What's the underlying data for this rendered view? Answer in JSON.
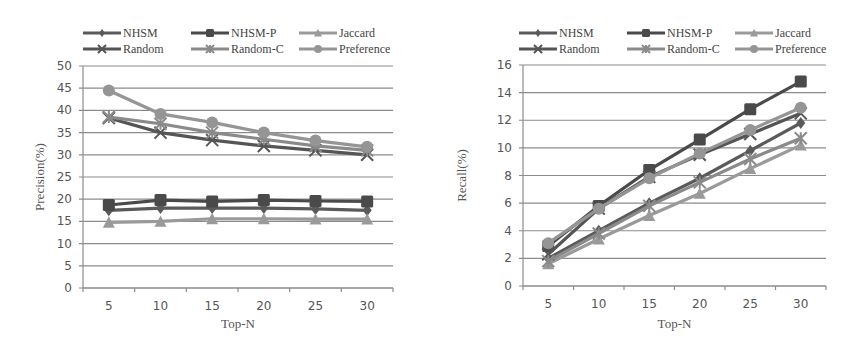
{
  "chart_data": [
    {
      "type": "line",
      "title": "",
      "xlabel": "Top-N",
      "ylabel": "Precision(%)",
      "categories": [
        "5",
        "10",
        "15",
        "20",
        "25",
        "30"
      ],
      "ylim": [
        0,
        50
      ],
      "yticks": [
        0,
        5,
        10,
        15,
        20,
        25,
        30,
        35,
        40,
        45,
        50
      ],
      "grid": true,
      "legend_position": "top",
      "series": [
        {
          "name": "NHSM",
          "color": "#5a5a5a",
          "marker": "diamond",
          "values": [
            17.5,
            18.0,
            18.0,
            18.0,
            17.8,
            17.5
          ]
        },
        {
          "name": "NHSM-P",
          "color": "#4a4a4a",
          "marker": "square",
          "values": [
            18.7,
            19.8,
            19.5,
            19.8,
            19.6,
            19.5
          ]
        },
        {
          "name": "Jaccard",
          "color": "#9a9a9a",
          "marker": "triangle",
          "values": [
            14.8,
            15.0,
            15.6,
            15.6,
            15.5,
            15.5
          ]
        },
        {
          "name": "Random",
          "color": "#555555",
          "marker": "x",
          "values": [
            38.3,
            35.0,
            33.3,
            32.0,
            31.0,
            30.0
          ]
        },
        {
          "name": "Random-C",
          "color": "#8a8a8a",
          "marker": "star",
          "values": [
            38.5,
            37.0,
            35.0,
            33.5,
            32.0,
            31.0
          ]
        },
        {
          "name": "Preference",
          "color": "#959595",
          "marker": "circle",
          "values": [
            44.5,
            39.2,
            37.3,
            35.0,
            33.2,
            31.8
          ]
        }
      ]
    },
    {
      "type": "line",
      "title": "",
      "xlabel": "Top-N",
      "ylabel": "Recall(%)",
      "categories": [
        "5",
        "10",
        "15",
        "20",
        "25",
        "30"
      ],
      "ylim": [
        0,
        16
      ],
      "yticks": [
        0,
        2,
        4,
        6,
        8,
        10,
        12,
        14,
        16
      ],
      "grid": true,
      "legend_position": "top",
      "series": [
        {
          "name": "NHSM",
          "color": "#5a5a5a",
          "marker": "diamond",
          "values": [
            2.0,
            4.0,
            6.0,
            7.8,
            9.8,
            11.8
          ]
        },
        {
          "name": "NHSM-P",
          "color": "#4a4a4a",
          "marker": "square",
          "values": [
            2.9,
            5.8,
            8.4,
            10.6,
            12.8,
            14.8
          ]
        },
        {
          "name": "Jaccard",
          "color": "#9a9a9a",
          "marker": "triangle",
          "values": [
            1.6,
            3.4,
            5.1,
            6.7,
            8.5,
            10.2
          ]
        },
        {
          "name": "Random",
          "color": "#555555",
          "marker": "x",
          "values": [
            2.3,
            5.6,
            7.9,
            9.5,
            11.0,
            12.5
          ]
        },
        {
          "name": "Random-C",
          "color": "#8a8a8a",
          "marker": "star",
          "values": [
            1.8,
            3.8,
            5.8,
            7.5,
            9.2,
            10.7
          ]
        },
        {
          "name": "Preference",
          "color": "#959595",
          "marker": "circle",
          "values": [
            3.1,
            5.6,
            7.8,
            9.6,
            11.3,
            12.9
          ]
        }
      ]
    }
  ],
  "charts": [
    {
      "ylabel": "Precision(%)",
      "xlabel": "Top-N",
      "legend": [
        "NHSM",
        "NHSM-P",
        "Jaccard",
        "Random",
        "Random-C",
        "Preference"
      ]
    },
    {
      "ylabel": "Recall(%)",
      "xlabel": "Top-N",
      "legend": [
        "NHSM",
        "NHSM-P",
        "Jaccard",
        "Random",
        "Random-C",
        "Preference"
      ]
    }
  ],
  "colors": {
    "grid": "#8c8c8c",
    "axis": "#8c8c8c",
    "background": "#ffffff"
  }
}
